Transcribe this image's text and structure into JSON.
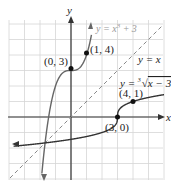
{
  "chart_data": {
    "type": "line",
    "title": "",
    "xlabel": "x",
    "ylabel": "y",
    "xlim": [
      -4,
      6
    ],
    "ylim": [
      -4,
      6
    ],
    "grid": true,
    "series": [
      {
        "name": "y = x^3 + 3",
        "color": "#555555",
        "style": "solid",
        "label_color": "#999999"
      },
      {
        "name": "y = x",
        "color": "#777777",
        "style": "dashed"
      },
      {
        "name": "y = cbrt(x - 3)",
        "color": "#333333",
        "style": "solid"
      }
    ],
    "points": [
      {
        "label": "(0, 3)",
        "x": 0,
        "y": 3
      },
      {
        "label": "(1, 4)",
        "x": 1,
        "y": 4
      },
      {
        "label": "(4, 1)",
        "x": 4,
        "y": 1
      },
      {
        "label": "(3, 0)",
        "x": 3,
        "y": 0
      }
    ]
  },
  "labels": {
    "x_axis": "x",
    "y_axis": "y",
    "f": "y = x",
    "f_sup": "3",
    "f_rest": " + 3",
    "identity": "y = x",
    "inv_prefix": "y = ",
    "inv_index": "3",
    "inv_radicand": "x − 3",
    "p03": "(0, 3)",
    "p14": "(1, 4)",
    "p41": "(4, 1)",
    "p30": "(3, 0)"
  }
}
